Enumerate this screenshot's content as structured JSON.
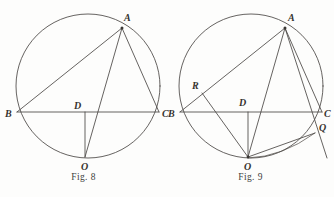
{
  "page": {
    "width": 334,
    "height": 197,
    "background_color": "#fdfdfc",
    "ink_color": "#4a4744"
  },
  "figures": [
    {
      "id": "fig-8",
      "caption": "Fig. 8",
      "circle": {
        "cx": 88,
        "cy": 86,
        "r": 72
      },
      "points": [
        {
          "label": "A",
          "x": 122,
          "y": 28,
          "label_x": 124,
          "label_y": 21
        },
        {
          "label": "B",
          "x": 17,
          "y": 112,
          "label_x": 8,
          "label_y": 117
        },
        {
          "label": "C",
          "x": 159,
          "y": 112,
          "label_x": 162,
          "label_y": 117
        },
        {
          "label": "D",
          "x": 85,
          "y": 112,
          "label_x": 76,
          "label_y": 109
        },
        {
          "label": "O",
          "x": 85,
          "y": 157,
          "label_x": 82,
          "label_y": 170
        }
      ],
      "segments": [
        {
          "name": "chord-BC",
          "from": "B",
          "to": "C"
        },
        {
          "name": "chord-AB",
          "from": "A",
          "to": "B"
        },
        {
          "name": "chord-AC",
          "from": "A",
          "to": "C"
        },
        {
          "name": "chord-AO",
          "from": "A",
          "to": "O"
        },
        {
          "name": "segment-DO",
          "from": "D",
          "to": "O"
        }
      ]
    },
    {
      "id": "fig-9",
      "caption": "Fig. 9",
      "circle": {
        "cx": 251,
        "cy": 86,
        "r": 72
      },
      "points": [
        {
          "label": "A",
          "x": 285,
          "y": 28,
          "label_x": 288,
          "label_y": 21
        },
        {
          "label": "B",
          "x": 180,
          "y": 112,
          "label_x": 171,
          "label_y": 117
        },
        {
          "label": "C",
          "x": 322,
          "y": 112,
          "label_x": 324,
          "label_y": 117
        },
        {
          "label": "D",
          "x": 248,
          "y": 112,
          "label_x": 240,
          "label_y": 106
        },
        {
          "label": "O",
          "x": 248,
          "y": 157,
          "label_x": 245,
          "label_y": 170
        },
        {
          "label": "R",
          "x": 202,
          "y": 93,
          "label_x": 194,
          "label_y": 89
        },
        {
          "label": "Q",
          "x": 315,
          "y": 133,
          "label_x": 320,
          "label_y": 131
        }
      ],
      "segments": [
        {
          "name": "chord-BC",
          "from": "B",
          "to": "C"
        },
        {
          "name": "chord-AB",
          "from": "A",
          "to": "B"
        },
        {
          "name": "chord-AC",
          "from": "A",
          "to": "C"
        },
        {
          "name": "chord-AO",
          "from": "A",
          "to": "O"
        },
        {
          "name": "segment-DO",
          "from": "D",
          "to": "O"
        },
        {
          "name": "segment-RO",
          "from": "R",
          "to": "O"
        },
        {
          "name": "segment-OQ",
          "from": "O",
          "to": "Q"
        },
        {
          "name": "secant-A-Q-extended",
          "from": "A",
          "to": "Q"
        }
      ],
      "arcs": [
        {
          "name": "arc-O-to-Q",
          "from": "O",
          "to": "Q"
        }
      ]
    }
  ]
}
